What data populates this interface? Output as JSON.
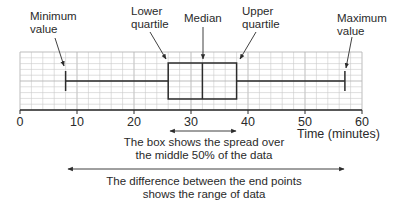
{
  "chart_data": {
    "type": "boxplot",
    "title": "",
    "xlabel": "Time (minutes)",
    "ylabel": "",
    "xlim": [
      0,
      60
    ],
    "x_ticks": [
      0,
      10,
      20,
      30,
      40,
      50,
      60
    ],
    "x_tick_labels": [
      "0",
      "10",
      "20",
      "30",
      "40",
      "50",
      "60"
    ],
    "grid": true,
    "minor_grid_step": 2,
    "values": {
      "minimum": 8,
      "lower_quartile": 26,
      "median": 32,
      "upper_quartile": 38,
      "maximum": 57
    },
    "annotations": {
      "minimum": [
        "Minimum",
        "value"
      ],
      "lower_quartile": [
        "Lower",
        "quartile"
      ],
      "median": [
        "Median"
      ],
      "upper_quartile": [
        "Upper",
        "quartile"
      ],
      "maximum": [
        "Maximum",
        "value"
      ],
      "box_note": [
        "The box shows the spread over",
        "the middle 50% of the data"
      ],
      "range_note": [
        "The difference between the end points",
        "shows the range of data"
      ]
    }
  },
  "colors": {
    "line": "#2b2b2b",
    "grid": "#c9c9c9",
    "text": "#2a2a2a"
  }
}
